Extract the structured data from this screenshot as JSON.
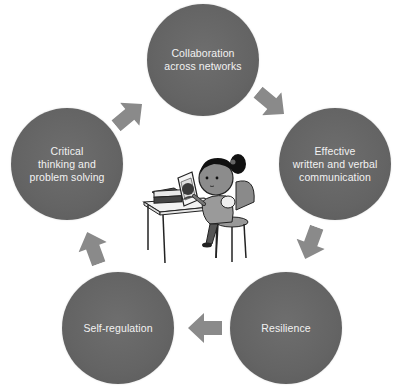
{
  "diagram": {
    "type": "cycle",
    "nodes": [
      {
        "id": "collaboration",
        "label": "Collaboration\nacross networks",
        "cx": 203,
        "cy": 60
      },
      {
        "id": "communication",
        "label": "Effective\nwritten and verbal\ncommunication",
        "cx": 335,
        "cy": 164
      },
      {
        "id": "resilience",
        "label": "Resilience",
        "cx": 286,
        "cy": 328
      },
      {
        "id": "self-regulation",
        "label": "Self-regulation",
        "cx": 118,
        "cy": 328
      },
      {
        "id": "critical-thinking",
        "label": "Critical\nthinking and\nproblem solving",
        "cx": 67,
        "cy": 164
      }
    ],
    "edges": [
      {
        "from": "collaboration",
        "to": "communication"
      },
      {
        "from": "communication",
        "to": "resilience"
      },
      {
        "from": "resilience",
        "to": "self-regulation"
      },
      {
        "from": "self-regulation",
        "to": "critical-thinking"
      },
      {
        "from": "critical-thinking",
        "to": "collaboration"
      }
    ],
    "center_image": "girl-reading-book-at-desk-illustration",
    "colors": {
      "node_fill": "#646464",
      "node_text": "#f2f2f2",
      "arrow_fill": "#8a8a8a",
      "background": "#ffffff"
    }
  }
}
